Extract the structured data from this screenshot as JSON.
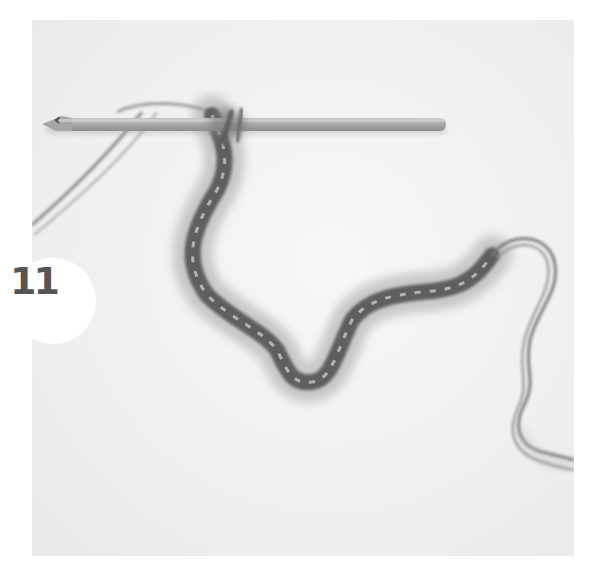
{
  "step": {
    "number": "11"
  },
  "photo": {
    "subject": "crochet hook with fuzzy yarn chain",
    "colors": {
      "background": "#f2f2f2",
      "hook": "#a8a8a8",
      "yarn_dark": "#5a5a5a",
      "yarn_fuzz": "#9a9a9a",
      "tail": "#8a8a8a",
      "badge": "#ffffff",
      "badge_text": "#555555"
    }
  }
}
